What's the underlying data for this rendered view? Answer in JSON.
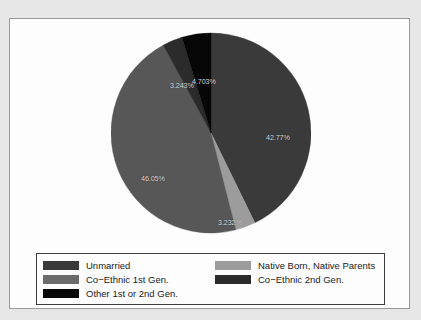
{
  "chart_data": {
    "type": "pie",
    "title": "",
    "subtitle": "",
    "xlabel": "",
    "ylabel": "",
    "legend_position": "bottom",
    "grid": false,
    "start_angle_deg": 90,
    "direction": "clockwise",
    "categories": [
      "Unmarried",
      "Native Born, Native Parents",
      "Co−Ethnic 1st Gen.",
      "Co−Ethnic 2nd Gen.",
      "Other 1st or 2nd Gen."
    ],
    "values": [
      42.77,
      3.232,
      46.05,
      3.243,
      4.703
    ],
    "value_labels": [
      "42.77%",
      "3.232%",
      "46.05%",
      "3.243%",
      "4.703%"
    ],
    "colors": [
      "#3a3a3a",
      "#9c9c9c",
      "#575757",
      "#2b2b2b",
      "#070707"
    ],
    "slices": [
      {
        "label": "Unmarried",
        "value": 42.77,
        "display": "42.77%",
        "color": "#3a3a3a"
      },
      {
        "label": "Native Born, Native Parents",
        "value": 3.232,
        "display": "3.232%",
        "color": "#9c9c9c"
      },
      {
        "label": "Co−Ethnic 1st Gen.",
        "value": 46.05,
        "display": "46.05%",
        "color": "#575757"
      },
      {
        "label": "Co−Ethnic 2nd Gen.",
        "value": 3.243,
        "display": "3.243%",
        "color": "#2b2b2b"
      },
      {
        "label": "Other 1st or 2nd Gen.",
        "value": 4.703,
        "display": "4.703%",
        "color": "#070707"
      }
    ]
  },
  "labels": {
    "unmarried_pct": "42.77%",
    "native_born_pct": "3.232%",
    "coethnic1_pct": "46.05%",
    "coethnic2_pct": "3.243%",
    "other_pct": "4.703%"
  },
  "legend": {
    "entries": [
      {
        "label": "Unmarried",
        "color": "#3a3a3a"
      },
      {
        "label": "Co−Ethnic 1st Gen.",
        "color": "#6b6b6b"
      },
      {
        "label": "Other 1st or 2nd Gen.",
        "color": "#070707"
      },
      {
        "label": "Native Born, Native Parents",
        "color": "#9c9c9c"
      },
      {
        "label": "Co−Ethnic 2nd Gen.",
        "color": "#2b2b2b"
      }
    ]
  }
}
